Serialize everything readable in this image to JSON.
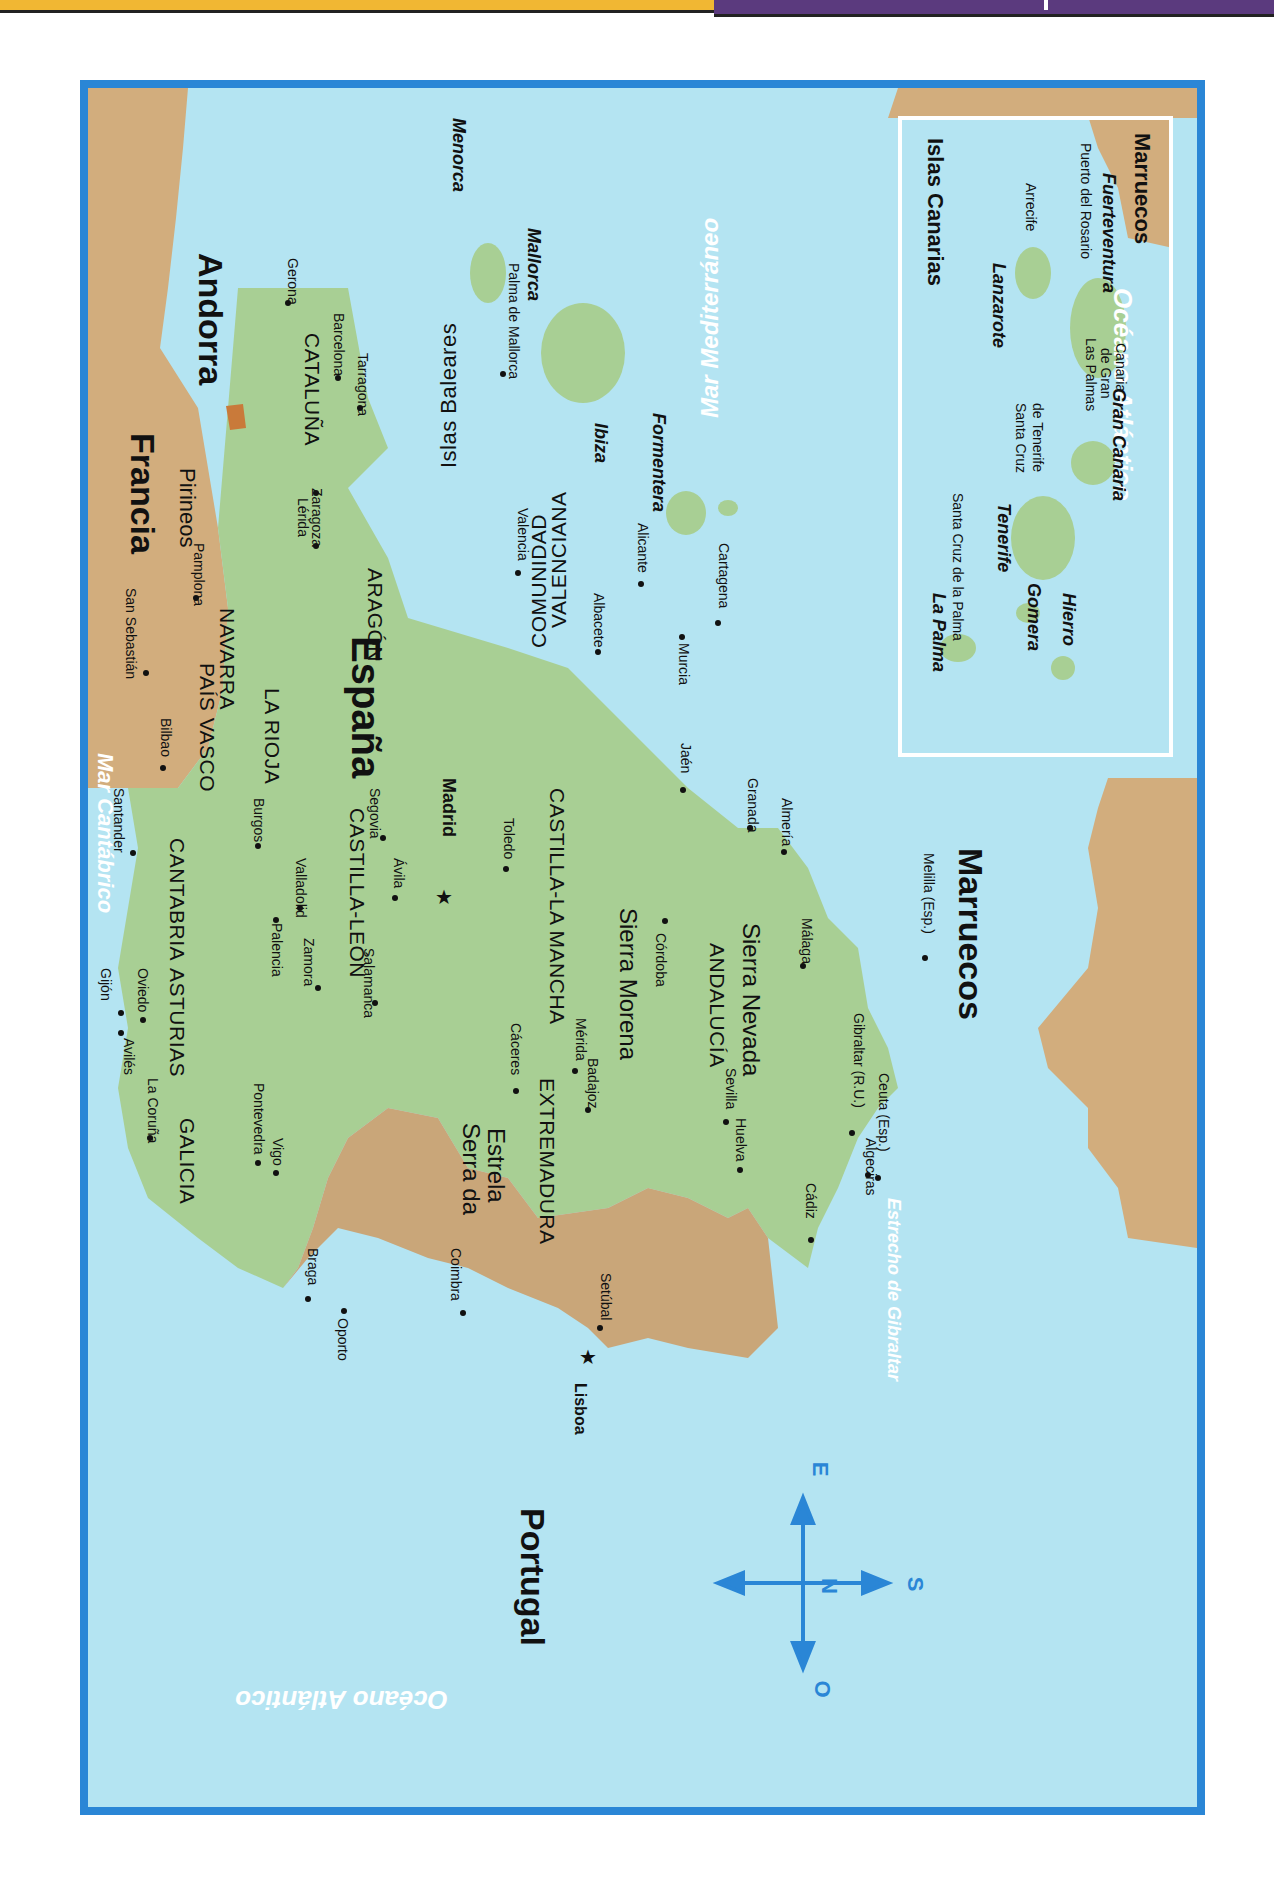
{
  "header": {
    "yellow_color": "#f1b733",
    "purple_color": "#5b3a7e"
  },
  "colors": {
    "sea": "#b4e4f2",
    "spain": "#a8cf94",
    "portugal": "#c9a679",
    "foreign_land": "#d2ad7d",
    "andorra": "#c97a3a",
    "frame": "#2a86d6"
  },
  "countries": {
    "francia": "Francia",
    "andorra": "Andorra",
    "espana": "España",
    "portugal": "Portugal",
    "marruecos": "Marruecos",
    "marruecos_inset": "Marruecos"
  },
  "seas": {
    "mar_cantabrico": "Mar Cantábrico",
    "mar_mediterraneo": "Mar Mediterráneo",
    "oceano_atlantico": "Océano Atlántico",
    "oceano_atlantico_inset": "Océano Atlántico",
    "estrecho": "Estrecho de Gibraltar"
  },
  "mountains": {
    "pirineos": "Pirineos",
    "sierra_morena": "Sierra Morena",
    "sierra_nevada": "Sierra Nevada",
    "serra_da_estrela_1": "Serra da",
    "serra_da_estrela_2": "Estrela"
  },
  "regions": {
    "galicia": "GALICIA",
    "asturias": "ASTURIAS",
    "cantabria": "CANTABRIA",
    "pais_vasco": "PAÍS VASCO",
    "navarra": "NAVARRA",
    "la_rioja": "LA RIOJA",
    "aragon": "ARAGÓN",
    "cataluna": "CATALUÑA",
    "castilla_leon": "CASTILLA-LEÓN",
    "castilla_la_mancha": "CASTILLA-LA MANCHA",
    "extremadura": "EXTREMADURA",
    "andalucia": "ANDALUCÍA",
    "comunidad": "COMUNIDAD",
    "valenciana": "VALENCIANA"
  },
  "cities": {
    "gerona": "Gerona",
    "barcelona": "Barcelona",
    "tarragona": "Tarragona",
    "lerida": "Lérida",
    "zaragoza": "Zaragoza",
    "pamplona": "Pamplona",
    "san_sebastian": "San Sebastián",
    "bilbao": "Bilbao",
    "santander": "Santander",
    "gijon": "Gijón",
    "oviedo": "Oviedo",
    "aviles": "Avilés",
    "la_coruna": "La Coruña",
    "pontevedra": "Pontevedra",
    "vigo": "Vigo",
    "burgos": "Burgos",
    "palencia": "Palencia",
    "valladolid": "Valladolid",
    "zamora": "Zamora",
    "salamanca": "Salamanca",
    "segovia": "Segovia",
    "avila": "Ávila",
    "madrid": "Madrid",
    "toledo": "Toledo",
    "valencia": "Valencia",
    "albacete": "Albacete",
    "alicante": "Alicante",
    "murcia": "Murcia",
    "cartagena": "Cartagena",
    "caceres": "Cáceres",
    "merida": "Mérida",
    "badajoz": "Badajoz",
    "cordoba": "Córdoba",
    "jaen": "Jaén",
    "granada": "Granada",
    "almeria": "Almería",
    "malaga": "Málaga",
    "sevilla": "Sevilla",
    "huelva": "Huelva",
    "cadiz": "Cádiz",
    "algeciras": "Algeciras",
    "gibraltar": "Gibraltar (R.U.)",
    "ceuta": "Ceuta (Esp.)",
    "melilla": "Melilla (Esp.)",
    "oporto": "Oporto",
    "braga": "Braga",
    "coimbra": "Coimbra",
    "setubal": "Setúbal",
    "lisboa": "Lisboa",
    "palma": "Palma de Mallorca"
  },
  "baleares": {
    "title": "Islas Baleares",
    "menorca": "Menorca",
    "mallorca": "Mallorca",
    "ibiza": "Ibiza",
    "formentera": "Formentera"
  },
  "canarias": {
    "title": "Islas Canarias",
    "la_palma": "La Palma",
    "sc_la_palma": "Santa Cruz de la Palma",
    "tenerife": "Tenerife",
    "sc_tenerife_1": "Santa Cruz",
    "sc_tenerife_2": "de Tenerife",
    "gomera": "Gomera",
    "hierro": "Hierro",
    "gran_canaria": "Gran Canaria",
    "lp_1": "Las Palmas",
    "lp_2": "de Gran",
    "lp_3": "Canaria",
    "lanzarote": "Lanzarote",
    "arrecife": "Arrecife",
    "fuerteventura": "Fuerteventura",
    "puerto_rosario": "Puerto del Rosario"
  },
  "compass": {
    "north": "N",
    "east": "E",
    "south": "S",
    "west": "O"
  }
}
